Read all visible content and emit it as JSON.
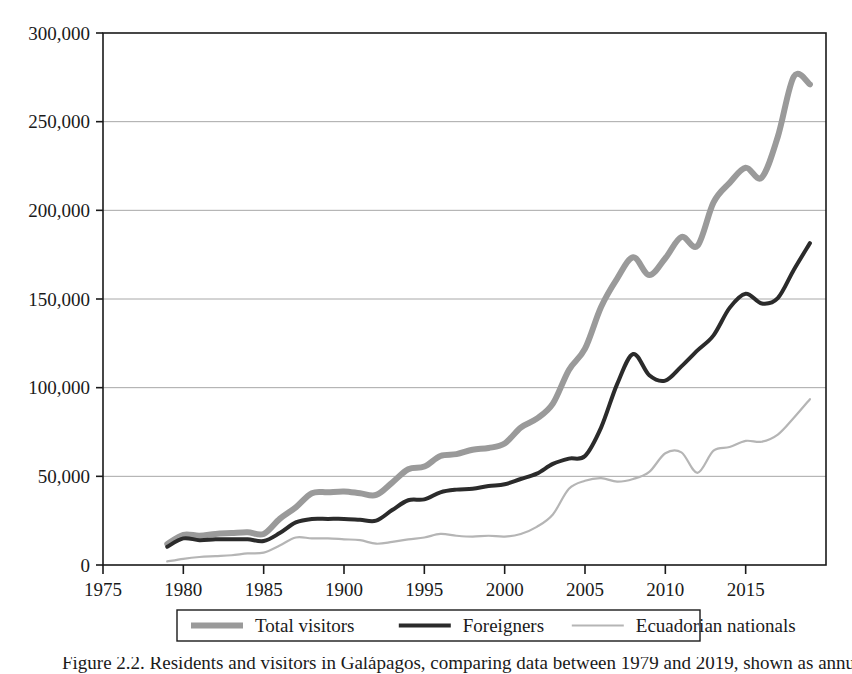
{
  "figure": {
    "caption": "Figure 2.2. Residents and visitors in Galápagos, comparing data between 1979 and 2019, shown as annual totals."
  },
  "chart_data": {
    "type": "line",
    "title": "",
    "xlabel": "",
    "ylabel": "",
    "xlim": [
      1975,
      2020
    ],
    "ylim": [
      0,
      300000
    ],
    "grid": "horizontal",
    "legend_position": "bottom",
    "y_ticks": [
      0,
      50000,
      100000,
      150000,
      200000,
      250000,
      300000
    ],
    "y_tick_labels": [
      "0",
      "50,000",
      "100,000",
      "150,000",
      "200,000",
      "250,000",
      "300,000"
    ],
    "x_ticks": [
      1975,
      1980,
      1985,
      1990,
      1995,
      2000,
      2005,
      2010,
      2015
    ],
    "x_tick_labels": [
      "1975",
      "1980",
      "1985",
      "1900",
      "1995",
      "2000",
      "2005",
      "2010",
      "2015"
    ],
    "x": [
      1979,
      1980,
      1981,
      1982,
      1983,
      1984,
      1985,
      1986,
      1987,
      1988,
      1989,
      1990,
      1991,
      1992,
      1993,
      1994,
      1995,
      1996,
      1997,
      1998,
      1999,
      2000,
      2001,
      2002,
      2003,
      2004,
      2005,
      2006,
      2007,
      2008,
      2009,
      2010,
      2011,
      2012,
      2013,
      2014,
      2015,
      2016,
      2017,
      2018,
      2019
    ],
    "series": [
      {
        "name": "Total visitors",
        "color": "#9a9a9a",
        "width": 6,
        "values": [
          11800,
          17000,
          16500,
          17500,
          18000,
          18500,
          17500,
          26000,
          32500,
          40500,
          41000,
          41500,
          40500,
          39500,
          46500,
          54000,
          55500,
          61500,
          62500,
          65000,
          66000,
          68500,
          77500,
          82500,
          91000,
          110000,
          122000,
          145500,
          161500,
          173500,
          163500,
          173000,
          185000,
          180000,
          204500,
          215500,
          224000,
          218500,
          241500,
          275500,
          271000
        ]
      },
      {
        "name": "Foreigners",
        "color": "#2b2b2b",
        "width": 4,
        "values": [
          10300,
          15000,
          14000,
          14500,
          14500,
          14500,
          13500,
          18000,
          24000,
          26000,
          26000,
          26000,
          25500,
          25000,
          31000,
          36500,
          37000,
          41000,
          42500,
          43000,
          44500,
          45500,
          48500,
          51500,
          57000,
          60000,
          61500,
          77500,
          102000,
          119000,
          107000,
          104000,
          112000,
          121000,
          129500,
          145000,
          153000,
          147500,
          150500,
          166500,
          181500
        ]
      },
      {
        "name": "Ecuadorian nationals",
        "color": "#b5b5b5",
        "width": 2.2,
        "values": [
          2000,
          3500,
          4500,
          5000,
          5500,
          6500,
          7000,
          11000,
          15500,
          15000,
          15000,
          14500,
          14000,
          12000,
          13000,
          14500,
          15500,
          17500,
          16500,
          16000,
          16500,
          16000,
          17500,
          21500,
          28500,
          43000,
          47500,
          49000,
          47000,
          48500,
          52500,
          63000,
          63500,
          52000,
          64500,
          66500,
          70000,
          69500,
          73500,
          83000,
          93500
        ]
      }
    ]
  },
  "legend": {
    "entries": [
      {
        "label": "Total visitors"
      },
      {
        "label": "Foreigners"
      },
      {
        "label": "Ecuadorian nationals"
      }
    ]
  }
}
